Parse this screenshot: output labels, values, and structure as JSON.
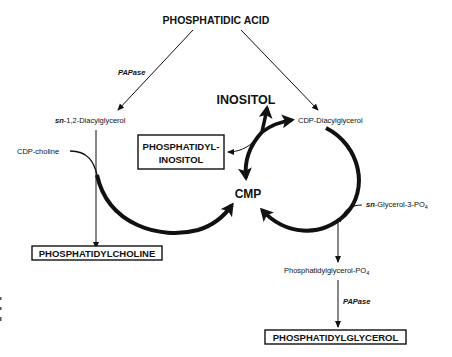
{
  "diagram": {
    "type": "metabolic-pathway",
    "nodes": {
      "phosphatidic_acid": "PHOSPHATIDIC ACID",
      "diacylglycerol_prefix": "sn",
      "diacylglycerol": "-1,2-Diacylglycerol",
      "cdp_diacylglycerol": "CDP-Diacylglycerol",
      "inositol": "INOSITOL",
      "phosphatidylinositol_line1": "PHOSPHATIDYL-",
      "phosphatidylinositol_line2": "INOSITOL",
      "cmp": "CMP",
      "cdp_choline": "CDP-choline",
      "phosphatidylcholine": "PHOSPHATIDYLCHOLINE",
      "glycerol3po4_prefix": "sn",
      "glycerol3po4": "-Glycerol-3-PO",
      "glycerol3po4_sub": "4",
      "phosphatidylglycerol_po4": "Phosphatidylglycerol-PO",
      "phosphatidylglycerol_po4_sub": "4",
      "phosphatidylglycerol": "PHOSPHATIDYLGLYCEROL"
    },
    "enzymes": {
      "papase_left": "PAPase",
      "papase_right": "PAPase"
    },
    "edges": [
      {
        "from": "PHOSPHATIDIC ACID",
        "to": "sn-1,2-Diacylglycerol",
        "label": "PAPase"
      },
      {
        "from": "PHOSPHATIDIC ACID",
        "to": "CDP-Diacylglycerol"
      },
      {
        "from": "sn-1,2-Diacylglycerol",
        "to": "PHOSPHATIDYLCHOLINE",
        "cofactor": "CDP-choline",
        "releases": "CMP"
      },
      {
        "from": "CDP-Diacylglycerol",
        "to": "PHOSPHATIDYL-INOSITOL",
        "cofactor": "INOSITOL",
        "releases": "CMP"
      },
      {
        "from": "CDP-Diacylglycerol",
        "to": "Phosphatidylglycerol-PO4",
        "cofactor": "sn-Glycerol-3-PO4",
        "releases": "CMP"
      },
      {
        "from": "Phosphatidylglycerol-PO4",
        "to": "PHOSPHATIDYLGLYCEROL",
        "label": "PAPase"
      }
    ]
  }
}
